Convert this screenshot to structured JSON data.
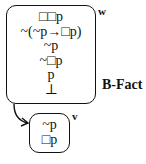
{
  "diagram": {
    "worlds": [
      {
        "id": "w",
        "label": "w",
        "lines": [
          "□□p",
          "~(~p→□p)",
          "~p",
          "~□p",
          "p",
          "⊥"
        ]
      },
      {
        "id": "v",
        "label": "v",
        "lines": [
          "~p",
          "□p"
        ]
      }
    ],
    "rule_label": "B-Fact",
    "arrow": {
      "from": "w",
      "to": "v"
    }
  }
}
